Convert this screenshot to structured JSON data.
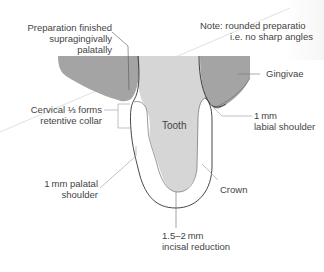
{
  "diagram": {
    "colors": {
      "gingiva": "#a4a4a4",
      "tooth": "#d6d6d6",
      "crown": "#ffffff",
      "outline": "#333333",
      "leader": "#8a8a8a"
    },
    "labels": {
      "prep_finished_line1": "Preparation finished",
      "prep_finished_line2": "supragingivally",
      "prep_finished_line3": "palatally",
      "note_line1": "Note:  rounded preparatio",
      "note_line2": "i.e. no sharp angles",
      "gingivae": "Gingivae",
      "cervical_line1": "Cervical ⅓ forms",
      "cervical_line2": "retentive collar",
      "tooth": "Tooth",
      "labial_line1": "1 mm",
      "labial_line2": "labial shoulder",
      "palatal_line1": "1 mm palatal",
      "palatal_line2": "shoulder",
      "crown": "Crown",
      "incisal_line1": "1.5–2 mm",
      "incisal_line2": "incisal reduction"
    }
  }
}
